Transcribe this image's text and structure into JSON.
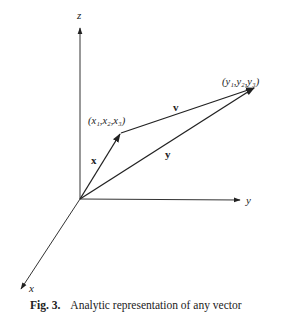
{
  "figure": {
    "axes": {
      "x_label": "x",
      "y_label": "y",
      "z_label": "z"
    },
    "points": {
      "origin": {
        "px": 80,
        "py": 199
      },
      "x_point": {
        "label": "(x₁,x₂,x₃)",
        "px": 120,
        "py": 134
      },
      "y_point": {
        "label": "(y₁,y₂,y₃)",
        "px": 255,
        "py": 88
      }
    },
    "vectors": {
      "x": {
        "label": "x",
        "from": "origin",
        "to": "x_point"
      },
      "y": {
        "label": "y",
        "from": "origin",
        "to": "y_point"
      },
      "v": {
        "label": "v",
        "from": "x_point",
        "to": "y_point"
      }
    },
    "colors": {
      "ink": "#222222",
      "background": "#ffffff"
    }
  },
  "caption": {
    "number": "Fig. 3.",
    "text": "Analytic representation of any vector"
  }
}
